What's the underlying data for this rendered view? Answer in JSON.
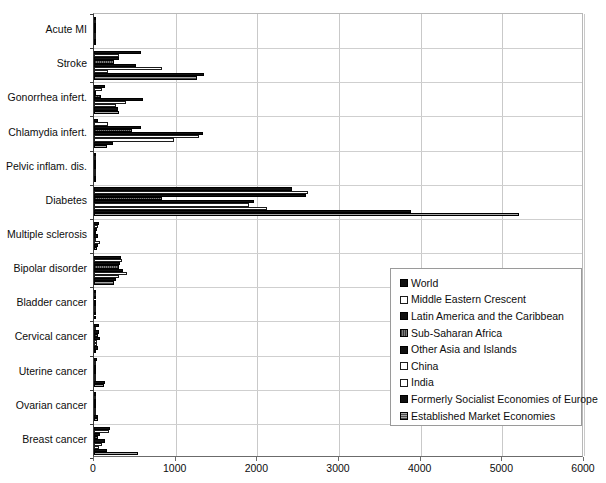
{
  "chart_data": {
    "type": "bar",
    "orientation": "horizontal",
    "title": "",
    "subtitle": "",
    "xlabel": "",
    "ylabel": "",
    "xlim": [
      0,
      6000
    ],
    "xticks": [
      0,
      1000,
      2000,
      3000,
      4000,
      5000,
      6000
    ],
    "xtick_labels": [
      "0",
      "1000",
      "2000",
      "3000",
      "4000",
      "5000",
      "6000"
    ],
    "grid": "vertical",
    "legend_position": "center-right",
    "categories": [
      "Acute MI",
      "Stroke",
      "Gonorrhea infert.",
      "Chlamydia infert.",
      "Pelvic inflam. dis.",
      "Diabetes",
      "Multiple sclerosis",
      "Bipolar disorder",
      "Bladder cancer",
      "Cervical cancer",
      "Uterine cancer",
      "Ovarian cancer",
      "Breast cancer"
    ],
    "series": [
      {
        "name": "World",
        "style": "solid",
        "color": "#111111",
        "values": [
          8,
          580,
          130,
          50,
          20,
          2430,
          58,
          330,
          14,
          60,
          36,
          30,
          195
        ]
      },
      {
        "name": "Middle Eastern Crescent",
        "style": "open",
        "color": "#ffffff",
        "values": [
          4,
          300,
          92,
          175,
          26,
          2620,
          46,
          340,
          6,
          26,
          14,
          10,
          185
        ]
      },
      {
        "name": "Latin America and the Caribbean",
        "style": "solid",
        "color": "#111111",
        "values": [
          3,
          305,
          26,
          570,
          17,
          2590,
          42,
          320,
          5,
          62,
          18,
          14,
          70
        ]
      },
      {
        "name": "Sub-Saharan Africa",
        "style": "hatch",
        "color": "#7d7d7d",
        "values": [
          3,
          250,
          90,
          470,
          12,
          830,
          30,
          300,
          4,
          50,
          12,
          11,
          55
        ]
      },
      {
        "name": "Other Asia and Islands",
        "style": "solid",
        "color": "#111111",
        "values": [
          3,
          520,
          600,
          1340,
          22,
          1960,
          44,
          360,
          7,
          70,
          30,
          26,
          140
        ]
      },
      {
        "name": "China",
        "style": "open",
        "color": "#ffffff",
        "values": [
          2,
          830,
          390,
          1290,
          14,
          1900,
          26,
          400,
          4,
          42,
          10,
          8,
          100
        ]
      },
      {
        "name": "India",
        "style": "open",
        "color": "#ffffff",
        "values": [
          2,
          175,
          270,
          975,
          10,
          2120,
          70,
          300,
          4,
          38,
          8,
          7,
          60
        ]
      },
      {
        "name": "Formerly Socialist Economies of Europe",
        "style": "solid",
        "color": "#111111",
        "values": [
          2,
          1350,
          290,
          230,
          11,
          3880,
          55,
          270,
          5,
          48,
          130,
          52,
          160
        ]
      },
      {
        "name": "Established Market Economies",
        "style": "gray",
        "color": "#8a8a8a",
        "values": [
          3,
          1260,
          305,
          160,
          9,
          5200,
          40,
          250,
          6,
          30,
          125,
          48,
          540
        ]
      }
    ]
  },
  "legend": {
    "items": [
      {
        "label": "World",
        "style": "solid"
      },
      {
        "label": "Middle Eastern Crescent",
        "style": "open"
      },
      {
        "label": "Latin America and the Caribbean",
        "style": "solid"
      },
      {
        "label": "Sub-Saharan Africa",
        "style": "hatch"
      },
      {
        "label": "Other Asia and Islands",
        "style": "solid"
      },
      {
        "label": "China",
        "style": "open"
      },
      {
        "label": "India",
        "style": "open"
      },
      {
        "label": "Formerly Socialist Economies of Europe",
        "style": "solid"
      },
      {
        "label": "Established Market Economies",
        "style": "gray"
      }
    ]
  },
  "artifact": {
    "bottom_text": ""
  }
}
